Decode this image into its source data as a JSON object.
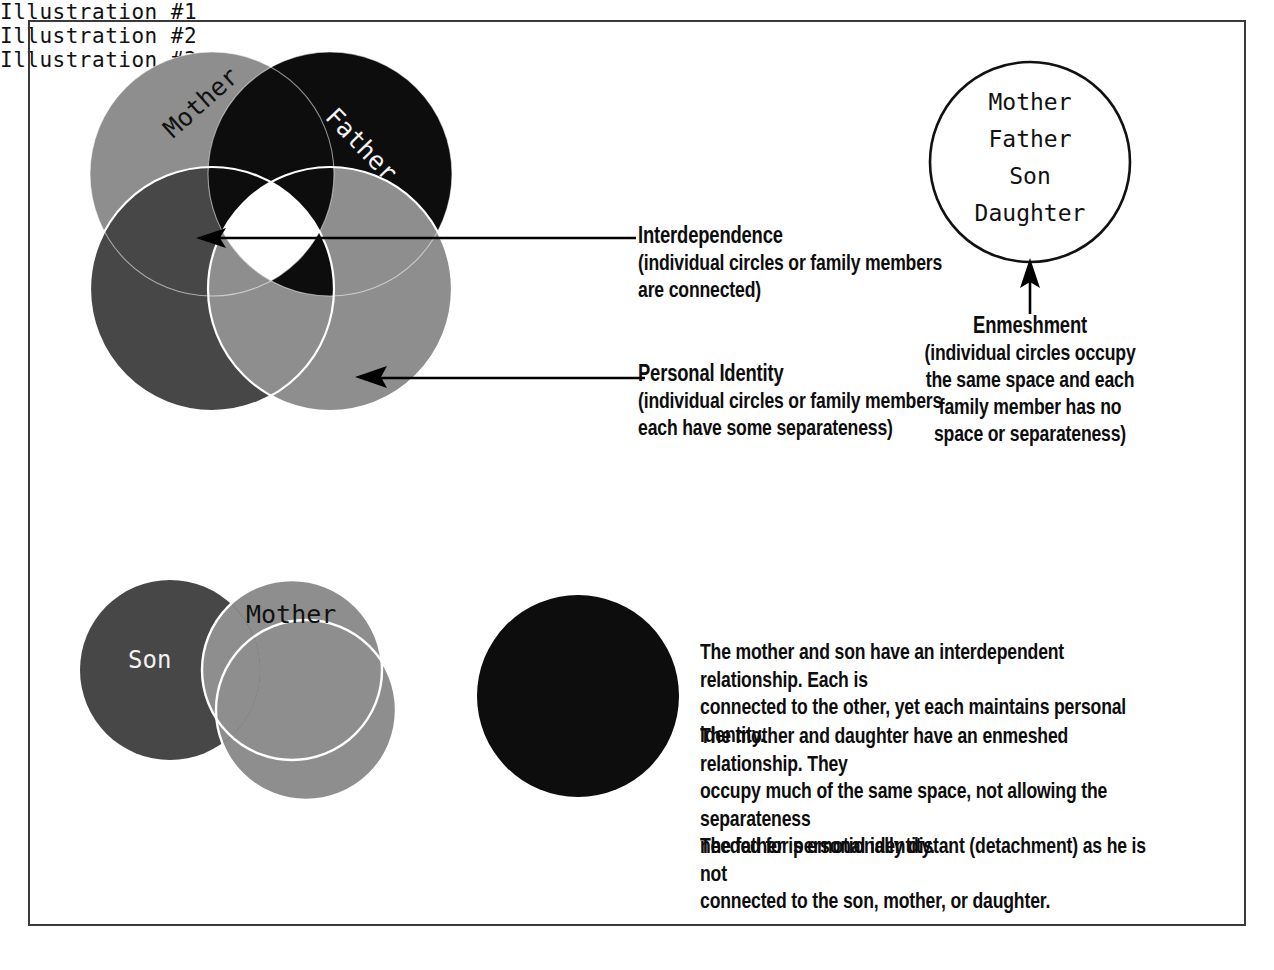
{
  "illustration1": {
    "caption": "Illustration #1",
    "labels": {
      "mother": "Mother",
      "father": "Father"
    },
    "colors": {
      "mother": "#8e8e8e",
      "father": "#0d0d0d",
      "son": "#474747",
      "daughter": "#8e8e8e",
      "core": "#ffffff",
      "outline": "#ffffff"
    }
  },
  "illustration2": {
    "caption": "Illustration #2",
    "members": [
      "Mother",
      "Father",
      "Son",
      "Daughter"
    ],
    "colors": {
      "fill": "#ffffff",
      "stroke": "#111111"
    }
  },
  "illustration3": {
    "caption": "Illustration #3",
    "labels": {
      "son": "Son",
      "mother": "Mother"
    },
    "colors": {
      "son": "#474747",
      "mother": "#8e8e8e",
      "daughter": "#8e8e8e",
      "father": "#0d0d0d",
      "outline": "#ffffff"
    }
  },
  "annotations": {
    "interdependence": {
      "heading": "Interdependence",
      "body_lines": [
        "(individual circles or family members",
        "are connected)"
      ]
    },
    "personal_identity": {
      "heading": "Personal Identity",
      "body_lines": [
        "(individual circles or family members",
        "each have some separateness)"
      ]
    },
    "enmeshment": {
      "heading": "Enmeshment",
      "body_lines": [
        "(individual circles occupy",
        "the same space and each",
        "family member has no",
        "space or separateness)"
      ]
    }
  },
  "paragraphs": [
    {
      "id": "p-mother-son",
      "lines": [
        "The mother and son have an interdependent relationship.  Each is",
        "connected to the other, yet each maintains personal identity."
      ]
    },
    {
      "id": "p-mother-daughter",
      "lines": [
        "The mother and daughter have an enmeshed relationship.  They",
        "occupy much of the same space, not allowing the separateness",
        "needed for personal identity."
      ]
    },
    {
      "id": "p-father",
      "lines": [
        "The father is emotionally distant (detachment) as he is not",
        "connected to the son, mother, or daughter."
      ]
    }
  ]
}
